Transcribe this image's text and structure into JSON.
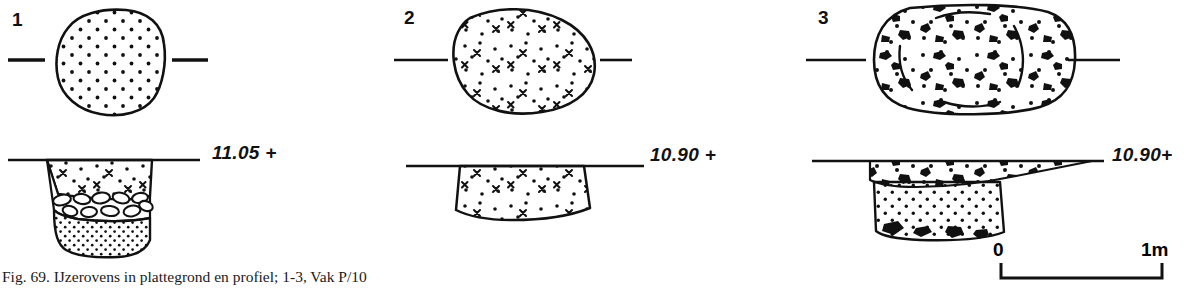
{
  "figure": {
    "caption": "Fig. 69. IJzerovens in plattegrond en profiel; 1-3, Vak P/10",
    "background_color": "#ffffff",
    "ink_color": "#000000"
  },
  "items": [
    {
      "number": "1",
      "plan": {
        "shape": "rounded-square-oval",
        "fill_pattern": "regular-dot-stipple",
        "section_marks": [
          "left-tick",
          "right-tick"
        ]
      },
      "profile": {
        "elevation_label": "11.05 +",
        "layers": [
          {
            "name": "upper-fill",
            "pattern": "dots-and-crosses"
          },
          {
            "name": "stone-layer",
            "pattern": "outlined-pebbles"
          },
          {
            "name": "lower-fill",
            "pattern": "dense-dot-stipple"
          }
        ]
      }
    },
    {
      "number": "2",
      "plan": {
        "shape": "irregular-oval",
        "fill_pattern": "dots-and-crosses",
        "section_marks": [
          "left-tick",
          "right-tick"
        ]
      },
      "profile": {
        "elevation_label": "10.90 +",
        "layers": [
          {
            "name": "single-fill",
            "pattern": "dots-and-crosses"
          }
        ]
      }
    },
    {
      "number": "3",
      "plan": {
        "shape": "wide-rounded-rectangle",
        "fill_pattern": "dots-blobs-and-arcs",
        "section_marks": [
          "left-tick",
          "right-tick"
        ]
      },
      "profile": {
        "elevation_label": "10.90+",
        "layers": [
          {
            "name": "upper-charcoal-band",
            "pattern": "dots-and-black-blobs"
          },
          {
            "name": "lower-fill",
            "pattern": "dot-stipple-with-blobs"
          }
        ]
      }
    }
  ],
  "scale_bar": {
    "start_label": "0",
    "end_label": "1m",
    "length_meters": 1
  }
}
